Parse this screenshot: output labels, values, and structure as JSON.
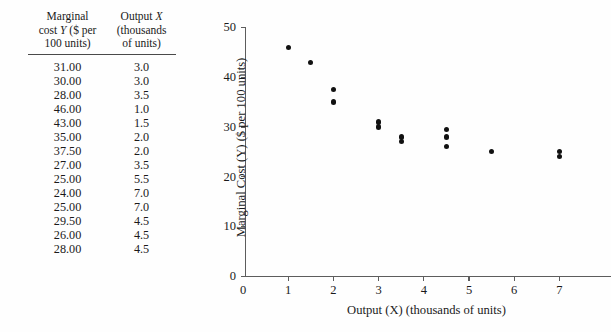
{
  "table": {
    "headers": [
      {
        "lines": [
          "Marginal",
          "cost Y ($ per",
          "100 units)"
        ]
      },
      {
        "lines": [
          "Output X",
          "(thousands",
          "of units)"
        ]
      }
    ],
    "rows": [
      {
        "y": "31.00",
        "x": "3.0"
      },
      {
        "y": "30.00",
        "x": "3.0"
      },
      {
        "y": "28.00",
        "x": "3.5"
      },
      {
        "y": "46.00",
        "x": "1.0"
      },
      {
        "y": "43.00",
        "x": "1.5"
      },
      {
        "y": "35.00",
        "x": "2.0"
      },
      {
        "y": "37.50",
        "x": "2.0"
      },
      {
        "y": "27.00",
        "x": "3.5"
      },
      {
        "y": "25.00",
        "x": "5.5"
      },
      {
        "y": "24.00",
        "x": "7.0"
      },
      {
        "y": "25.00",
        "x": "7.0"
      },
      {
        "y": "29.50",
        "x": "4.5"
      },
      {
        "y": "26.00",
        "x": "4.5"
      },
      {
        "y": "28.00",
        "x": "4.5"
      }
    ]
  },
  "chart_data": {
    "type": "scatter",
    "title": "",
    "xlabel": "Output (X) (thousands of units)",
    "ylabel": "Marginal Cost (Y) ($ per 100 units)",
    "xlim": [
      0,
      7.7
    ],
    "ylim": [
      0,
      50
    ],
    "xticks": [
      0,
      1,
      2,
      3,
      4,
      5,
      6,
      7
    ],
    "xtick_labels": [
      "0",
      "1",
      "2",
      "3",
      "4",
      "5",
      "6",
      "7"
    ],
    "yticks": [
      0,
      10,
      20,
      30,
      40,
      50
    ],
    "ytick_labels": [
      "0",
      "10",
      "20",
      "30",
      "40",
      "50"
    ],
    "grid": false,
    "legend": null,
    "marker_color": "#111111",
    "axis_color": "#5d5d5d",
    "points": [
      {
        "x": 1.0,
        "y": 46.0
      },
      {
        "x": 1.5,
        "y": 43.0
      },
      {
        "x": 2.0,
        "y": 37.5
      },
      {
        "x": 2.0,
        "y": 35.0
      },
      {
        "x": 3.0,
        "y": 31.0
      },
      {
        "x": 3.0,
        "y": 30.0
      },
      {
        "x": 3.5,
        "y": 28.0
      },
      {
        "x": 3.5,
        "y": 27.0
      },
      {
        "x": 4.5,
        "y": 29.5
      },
      {
        "x": 4.5,
        "y": 28.0
      },
      {
        "x": 4.5,
        "y": 26.0
      },
      {
        "x": 5.5,
        "y": 25.0
      },
      {
        "x": 7.0,
        "y": 25.0
      },
      {
        "x": 7.0,
        "y": 24.0
      }
    ]
  }
}
